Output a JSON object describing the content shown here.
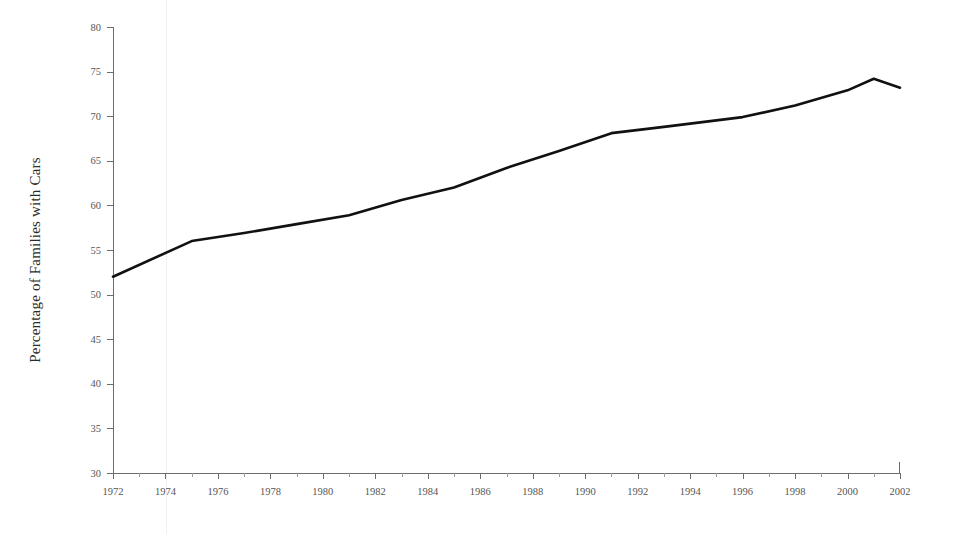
{
  "chart_data": {
    "type": "line",
    "title": "",
    "subtitle": "",
    "xlabel": "",
    "ylabel": "Percentage of Families with Cars",
    "xlim": [
      1972,
      2002
    ],
    "ylim": [
      30,
      80
    ],
    "grid": false,
    "legend": false,
    "legend_position": "none",
    "y_ticks": [
      30,
      35,
      40,
      45,
      50,
      55,
      60,
      65,
      70,
      75,
      80
    ],
    "y_tick_labels": [
      "30",
      "35",
      "40",
      "45",
      "50",
      "55",
      "60",
      "65",
      "70",
      "75",
      "80"
    ],
    "x_ticks": [
      1972,
      1974,
      1976,
      1978,
      1980,
      1982,
      1984,
      1986,
      1988,
      1990,
      1992,
      1994,
      1996,
      1998,
      2000,
      2002
    ],
    "x_tick_labels": [
      "1972",
      "1974",
      "1976",
      "1978",
      "1980",
      "1982",
      "1984",
      "1986",
      "1988",
      "1990",
      "1992",
      "1994",
      "1996",
      "1998",
      "2000",
      "2002"
    ],
    "x_minor_ticks": [
      1973,
      1975,
      1977,
      1979,
      1981,
      1983,
      1985,
      1987,
      1989,
      1991,
      1993,
      1995,
      1997,
      1999,
      2001
    ],
    "series": [
      {
        "name": "Percentage of Families with Cars",
        "color": "#111111",
        "line_width": 2.6,
        "x": [
          1972,
          1975,
          1977,
          1979,
          1981,
          1983,
          1985,
          1987,
          1989,
          1991,
          1993,
          1996,
          1998,
          2000,
          2001,
          2002
        ],
        "values": [
          52.0,
          56.0,
          56.9,
          57.9,
          58.9,
          60.6,
          62.0,
          64.2,
          66.1,
          68.1,
          68.8,
          69.9,
          71.2,
          72.9,
          74.2,
          73.2
        ]
      }
    ],
    "annotations": []
  },
  "axes": {
    "y_axis_name": "percentage-axis",
    "x_axis_name": "year-axis"
  }
}
